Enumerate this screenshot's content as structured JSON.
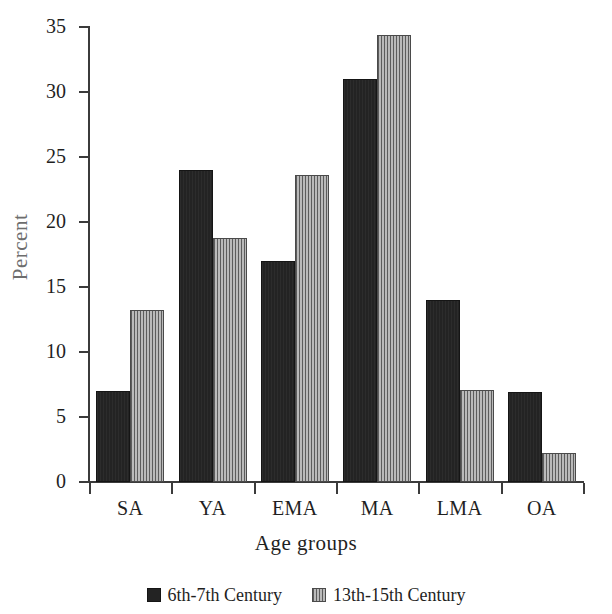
{
  "chart_data": {
    "type": "bar",
    "title": "",
    "subtitle": "",
    "xlabel": "Age groups",
    "ylabel": "Percent",
    "categories": [
      "SA",
      "YA",
      "EMA",
      "MA",
      "LMA",
      "OA"
    ],
    "series": [
      {
        "name": "6th-7th Century",
        "color": "#232323",
        "pattern": "solid-dark",
        "values": [
          7.0,
          24.0,
          17.0,
          31.0,
          14.0,
          6.9
        ]
      },
      {
        "name": "13th-15th Century",
        "color": "#9c9c9c",
        "pattern": "vertical-hatch-gray",
        "values": [
          13.2,
          18.8,
          23.6,
          34.4,
          7.1,
          2.2
        ]
      }
    ],
    "ylim": [
      0,
      35
    ],
    "yticks": [
      0,
      5,
      10,
      15,
      20,
      25,
      30,
      35
    ],
    "ytick_labels": [
      "0",
      "5",
      "10",
      "15",
      "20",
      "25",
      "30",
      "35"
    ],
    "grid": false,
    "legend_position": "bottom-center",
    "legend_entries": [
      "6th-7th Century",
      "13th-15th Century"
    ]
  }
}
